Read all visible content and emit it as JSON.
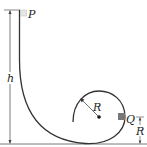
{
  "diagram": {
    "type": "physics-loop-track",
    "labels": {
      "start_point": "P",
      "block": "Q",
      "height": "h",
      "radius_loop": "R",
      "radius_height": "R"
    },
    "colors": {
      "track": "#333333",
      "block": "#777777",
      "start_block": "#dddddd",
      "dimension": "#444444"
    }
  }
}
